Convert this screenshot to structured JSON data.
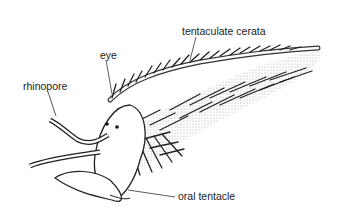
{
  "figure": {
    "labels": {
      "tentaculate_cerata": "tentaculate cerata",
      "eye": "eye",
      "rhinopore": "rhinopore",
      "oral_tentacle": "oral tentacle"
    }
  }
}
